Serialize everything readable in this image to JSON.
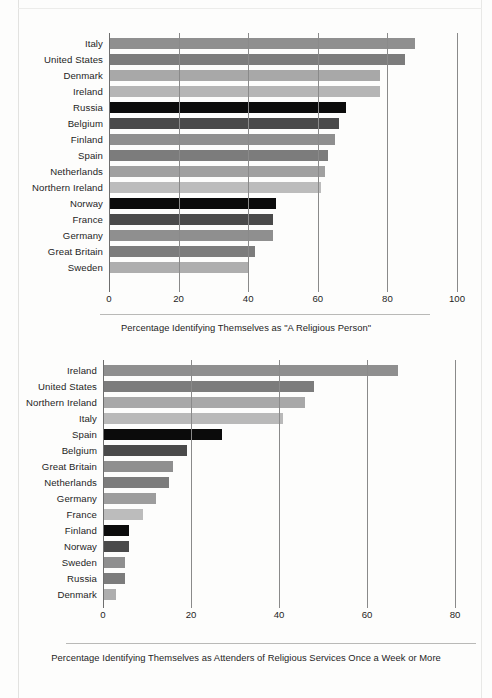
{
  "figure": {
    "background": "#fdfdfc",
    "bar_palette": {
      "black": "#0b0b0b",
      "dark_gray": "#4a4a4a",
      "mid_gray": "#7c7c7c",
      "gray": "#8f8f8f",
      "light_gray": "#b0b0b0",
      "pale_gray": "#c6c6c6"
    }
  },
  "chart_data": [
    {
      "type": "bar",
      "orientation": "horizontal",
      "title": "",
      "caption": "Percentage Identifying Themselves as \"A Religious Person\"",
      "xlabel": "",
      "ylabel": "",
      "xlim": [
        0,
        100
      ],
      "xticks": [
        0,
        20,
        40,
        60,
        80,
        100
      ],
      "xtick_labels": [
        "0",
        "20",
        "40",
        "60",
        "80",
        "100"
      ],
      "grid": true,
      "legend": "none",
      "categories": [
        "Italy",
        "United States",
        "Denmark",
        "Ireland",
        "Russia",
        "Belgium",
        "Finland",
        "Spain",
        "Netherlands",
        "Northern Ireland",
        "Norway",
        "France",
        "Germany",
        "Great Britain",
        "Sweden"
      ],
      "values": [
        88,
        85,
        78,
        78,
        68,
        66,
        65,
        63,
        62,
        61,
        48,
        47,
        47,
        42,
        40
      ],
      "colors": [
        "#8f8f8f",
        "#7c7c7c",
        "#a8a8a8",
        "#b5b5b5",
        "#0b0b0b",
        "#4a4a4a",
        "#8f8f8f",
        "#7c7c7c",
        "#a0a0a0",
        "#bcbcbc",
        "#0b0b0b",
        "#4a4a4a",
        "#8f8f8f",
        "#7c7c7c",
        "#aeaeae"
      ]
    },
    {
      "type": "bar",
      "orientation": "horizontal",
      "title": "",
      "caption": "Percentage Identifying Themselves as Attenders of Religious Services Once a Week or More",
      "xlabel": "",
      "ylabel": "",
      "xlim": [
        0,
        80
      ],
      "xticks": [
        0,
        20,
        40,
        60,
        80
      ],
      "xtick_labels": [
        "0",
        "20",
        "40",
        "60",
        "80"
      ],
      "grid": true,
      "legend": "none",
      "categories": [
        "Ireland",
        "United States",
        "Northern Ireland",
        "Italy",
        "Spain",
        "Belgium",
        "Great Britain",
        "Netherlands",
        "Germany",
        "France",
        "Finland",
        "Norway",
        "Sweden",
        "Russia",
        "Denmark"
      ],
      "values": [
        67,
        48,
        46,
        41,
        27,
        19,
        16,
        15,
        12,
        9,
        6,
        6,
        5,
        5,
        3
      ],
      "colors": [
        "#8f8f8f",
        "#7c7c7c",
        "#a8a8a8",
        "#b9b9b9",
        "#0b0b0b",
        "#4a4a4a",
        "#8f8f8f",
        "#7c7c7c",
        "#9d9d9d",
        "#bcbcbc",
        "#0b0b0b",
        "#4a4a4a",
        "#8f8f8f",
        "#7c7c7c",
        "#aeaeae"
      ]
    }
  ]
}
